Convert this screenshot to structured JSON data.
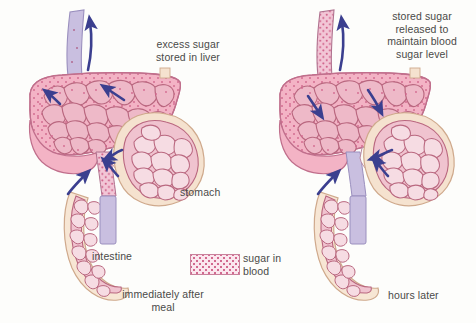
{
  "figure": {
    "background_color": "#fdfdfb",
    "panels": [
      {
        "id": "left",
        "caption": "immediately after\nmeal",
        "annotation": "excess sugar\nstored in liver",
        "sugar_flow": "into-liver"
      },
      {
        "id": "right",
        "caption": "hours later",
        "annotation": "stored sugar\nreleased to\nmaintain blood\nsugar level",
        "sugar_flow": "out-of-liver"
      }
    ]
  },
  "labels": {
    "excess_sugar": "excess sugar\nstored in liver",
    "stored_sugar": "stored sugar\nreleased to\nmaintain blood\nsugar level",
    "stomach": "stomach",
    "intestine": "intestine",
    "after_meal": "immediately after\nmeal",
    "hours_later": "hours later"
  },
  "legend": {
    "swatch_name": "sugar-in-blood-swatch",
    "text": "sugar in\nblood",
    "fill_color": "#fbe7ee",
    "dot_color": "#d2698f",
    "border_color": "#c9829c"
  },
  "colors": {
    "liver_fill": "#f3b3c5",
    "liver_outline": "#c06f8c",
    "liver_cells_fill": "#eeb9c8",
    "cell_outline": "#b9677f",
    "stomach_outer": "#f5e2cf",
    "stomach_outline": "#cfa98c",
    "intestine_outer": "#f7e6d4",
    "vein_plain": "#c6bcdc",
    "vein_outline": "#9a8fbe",
    "arrow_blue": "#3b3f8f",
    "sugar_dot": "#d2698f",
    "text": "#4a4a48"
  },
  "anatomy": {
    "organs": [
      "liver",
      "stomach",
      "intestine",
      "hepatic vein",
      "portal vein"
    ],
    "arrow_count_left": 5,
    "arrow_count_right": 5
  }
}
